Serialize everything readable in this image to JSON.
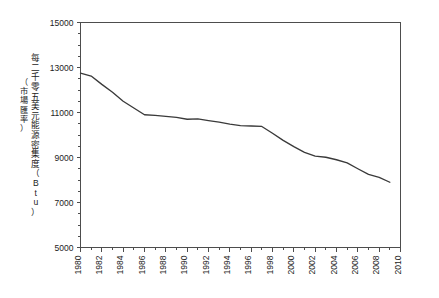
{
  "chart_data": {
    "type": "line",
    "title": "",
    "subtitle": "",
    "xlabel": "",
    "ylabel": "每二千零五美元能源密集度（Btu）",
    "ylabel_sub": "（市場匯率）",
    "ylabel_chars": [
      "每",
      "二",
      "千",
      "零",
      "五",
      "美",
      "元",
      "能",
      "源",
      "密",
      "集",
      "度",
      "（",
      "B",
      "t",
      "u",
      "）"
    ],
    "ylabel_sub_chars": [
      "（",
      "市",
      "場",
      "匯",
      "率",
      "）"
    ],
    "xlim": [
      1980,
      2010
    ],
    "ylim": [
      5000,
      15000
    ],
    "grid": false,
    "legend": null,
    "legend_position": "none",
    "line_color": "#3a3a3a",
    "y_ticks": [
      5000,
      7000,
      9000,
      11000,
      13000,
      15000
    ],
    "y_tick_labels": [
      "5000",
      "7000",
      "9000",
      "11000",
      "13000",
      "15000"
    ],
    "y_minor_tick_step": 500,
    "x_ticks": [
      1980,
      1982,
      1984,
      1986,
      1988,
      1990,
      1992,
      1994,
      1996,
      1998,
      2000,
      2002,
      2004,
      2006,
      2008,
      2010
    ],
    "x_tick_labels": [
      "1980",
      "1982",
      "1984",
      "1986",
      "1988",
      "1990",
      "1992",
      "1994",
      "1996",
      "1998",
      "2000",
      "2002",
      "2004",
      "2006",
      "2008",
      "2010"
    ],
    "x_minor_tick_step": 1,
    "x": [
      1980,
      1981,
      1982,
      1983,
      1984,
      1985,
      1986,
      1987,
      1988,
      1989,
      1990,
      1991,
      1992,
      1993,
      1994,
      1995,
      1996,
      1997,
      1998,
      1999,
      2000,
      2001,
      2002,
      2003,
      2004,
      2005,
      2006,
      2007,
      2008,
      2009
    ],
    "values": [
      12750,
      12620,
      12250,
      11900,
      11500,
      11200,
      10900,
      10870,
      10830,
      10780,
      10700,
      10720,
      10640,
      10570,
      10480,
      10420,
      10400,
      10380,
      10080,
      9760,
      9480,
      9230,
      9060,
      9010,
      8900,
      8760,
      8500,
      8250,
      8120,
      7900
    ],
    "series": [
      {
        "name": "能源密集度",
        "values": [
          12750,
          12620,
          12250,
          11900,
          11500,
          11200,
          10900,
          10870,
          10830,
          10780,
          10700,
          10720,
          10640,
          10570,
          10480,
          10420,
          10400,
          10380,
          10080,
          9760,
          9480,
          9230,
          9060,
          9010,
          8900,
          8760,
          8500,
          8250,
          8120,
          7900
        ]
      }
    ],
    "units": "Btu",
    "annotations": []
  }
}
